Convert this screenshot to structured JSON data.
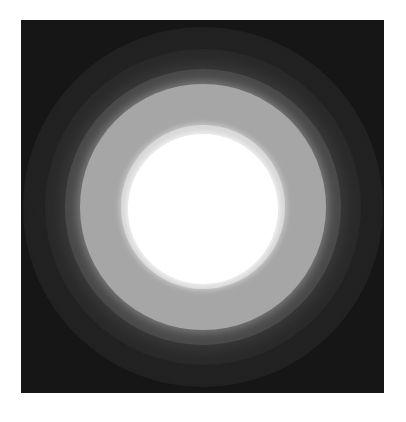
{
  "image": {
    "description": "Concentric circular glow on dark square background",
    "background_color": "#161616",
    "rings": [
      {
        "name": "outer-halo",
        "radius": 180,
        "color": "#1e1e1e"
      },
      {
        "name": "dark-ring",
        "radius": 158,
        "color": "#2a2a2a"
      },
      {
        "name": "mid-dark-ring",
        "radius": 138,
        "color": "#474747"
      },
      {
        "name": "gray-ring",
        "radius": 123,
        "color": "#a3a3a3"
      },
      {
        "name": "light-ring",
        "radius": 82,
        "color": "#d8d8d8"
      },
      {
        "name": "core",
        "radius": 75,
        "color": "#ffffff"
      }
    ]
  }
}
